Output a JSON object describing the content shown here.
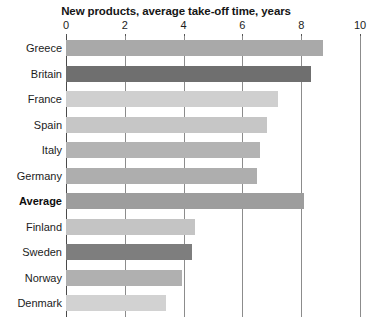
{
  "chart_data": {
    "type": "bar",
    "orientation": "horizontal",
    "title": "New products, average take-off time, years",
    "xlabel": "",
    "ylabel": "",
    "xlim": [
      0,
      10
    ],
    "xticks": [
      0,
      2,
      4,
      6,
      8,
      10
    ],
    "xtick_labels": [
      "0",
      "2",
      "4",
      "6",
      "8",
      "10"
    ],
    "grid": "vertical",
    "legend": "none",
    "categories": [
      "Greece",
      "Britain",
      "France",
      "Spain",
      "Italy",
      "Germany",
      "Average",
      "Finland",
      "Sweden",
      "Norway",
      "Denmark"
    ],
    "values": [
      8.75,
      8.35,
      7.2,
      6.85,
      6.6,
      6.5,
      8.1,
      4.4,
      4.3,
      3.95,
      3.4
    ],
    "bar_colors": [
      "#a9a9a9",
      "#6f6f6f",
      "#cfcfcf",
      "#c6c6c6",
      "#b3b3b3",
      "#aeaeae",
      "#9d9d9d",
      "#c4c4c4",
      "#7e7e7e",
      "#b0b0b0",
      "#d2d2d2"
    ],
    "emphasized_categories": [
      "Average"
    ],
    "axis_color": "#4a4a4a",
    "gridline_color": "#8c8c8c"
  }
}
